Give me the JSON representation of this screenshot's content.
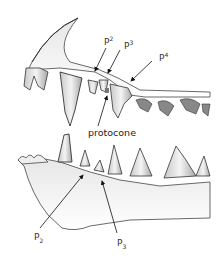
{
  "diagram": {
    "labels": {
      "upper_p2": {
        "base": "P",
        "index": "2"
      },
      "upper_p3": {
        "base": "P",
        "index": "3"
      },
      "upper_p4": {
        "base": "P",
        "index": "4"
      },
      "protocone": "protocone",
      "lower_p2": {
        "base": "P",
        "index": "2"
      },
      "lower_p3": {
        "base": "P",
        "index": "3"
      }
    },
    "colors": {
      "line": "#222222",
      "tooth_fill": "#f2f2f2",
      "shade": "#9a9a9a",
      "background": "#ffffff"
    }
  }
}
